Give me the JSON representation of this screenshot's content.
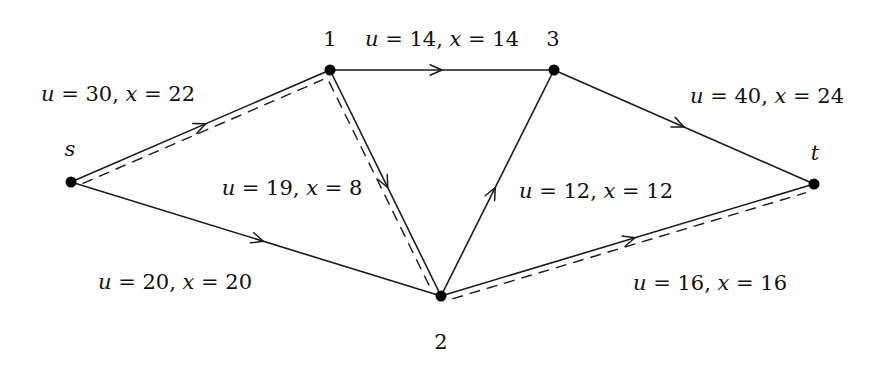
{
  "nodes": [
    {
      "id": "s",
      "label": "s"
    },
    {
      "id": "1",
      "label": "1"
    },
    {
      "id": "3",
      "label": "3"
    },
    {
      "id": "2",
      "label": "2"
    },
    {
      "id": "t",
      "label": "t"
    }
  ],
  "edges": [
    {
      "from": "s",
      "to": "1",
      "label": "u = 30, x = 22",
      "capacity": 30,
      "flow": 22
    },
    {
      "from": "s",
      "to": "2",
      "label": "u = 20, x = 20",
      "capacity": 20,
      "flow": 20
    },
    {
      "from": "1",
      "to": "3",
      "label": "u = 14, x = 14",
      "capacity": 14,
      "flow": 14
    },
    {
      "from": "1",
      "to": "2",
      "label": "u = 19, x = 8",
      "capacity": 19,
      "flow": 8
    },
    {
      "from": "2",
      "to": "3",
      "label": "u = 12, x = 12",
      "capacity": 12,
      "flow": 12
    },
    {
      "from": "3",
      "to": "t",
      "label": "u = 40, x = 24",
      "capacity": 40,
      "flow": 24
    },
    {
      "from": "2",
      "to": "t",
      "label": "u = 16, x = 16",
      "capacity": 16,
      "flow": 16
    }
  ],
  "dashed_path": [
    "s",
    "1",
    "2",
    "t"
  ]
}
